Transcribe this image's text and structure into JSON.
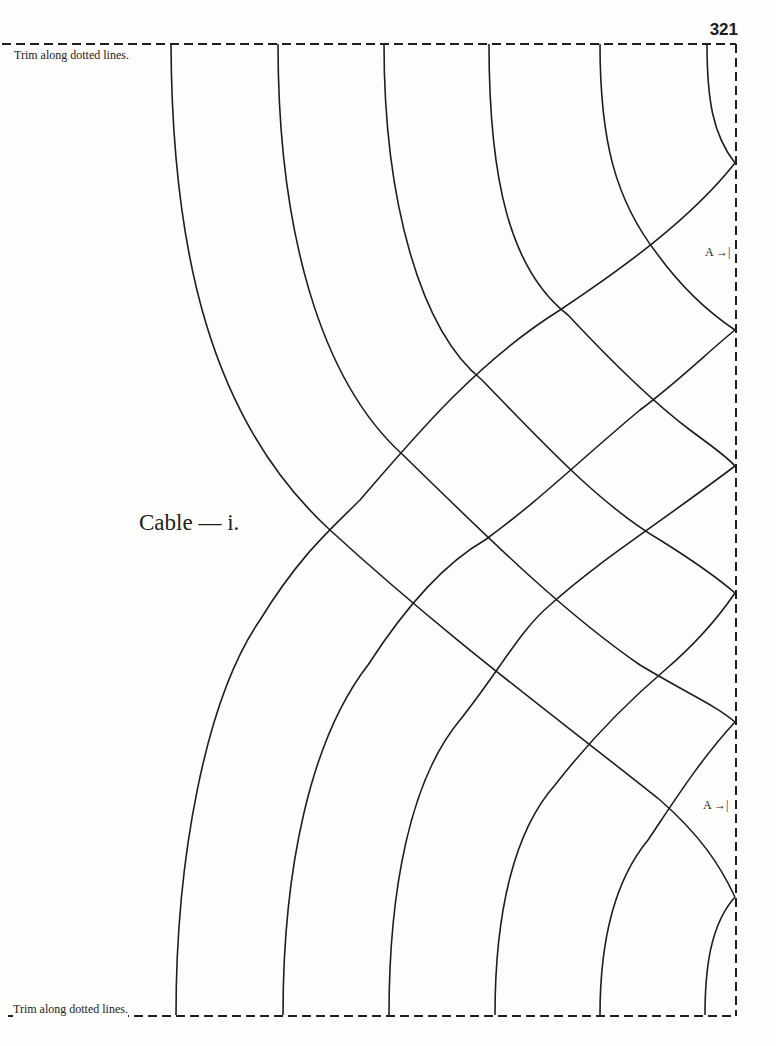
{
  "page": {
    "number": "321",
    "title": "Cable — i.",
    "trim_instruction_top": "Trim along dotted lines.",
    "trim_instruction_bottom": "Trim along dotted lines.",
    "markers": [
      {
        "label": "A →|",
        "position": "upper-right"
      },
      {
        "label": "A →|",
        "position": "lower-right"
      }
    ]
  },
  "colors": {
    "paper": "#fdfdfc",
    "ink": "#1e1e1e"
  }
}
